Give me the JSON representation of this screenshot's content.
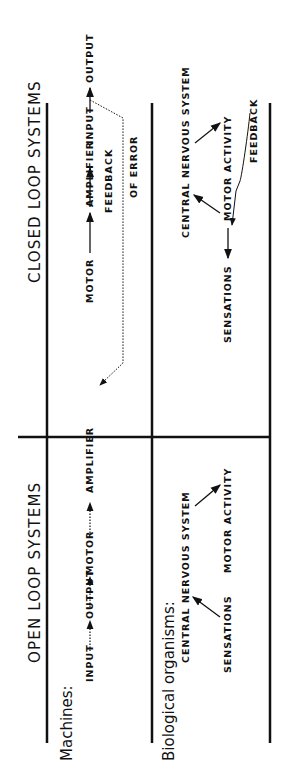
{
  "headers": {
    "open": "OPEN LOOP SYSTEMS",
    "closed": "CLOSED LOOP SYSTEMS"
  },
  "rows": {
    "machines": "Machines:",
    "biological": "Biological organisms:"
  },
  "open_machine": {
    "input": "INPUT",
    "amplifier": "AMPLIFIER",
    "motor": "MOTOR",
    "output": "OUTPUT"
  },
  "closed_machine": {
    "input": "INPUT",
    "amplifier": "AMPLIFIER",
    "motor": "MOTOR",
    "output": "OUTPUT",
    "feedback1": "FEEDBACK",
    "feedback2": "OF ERROR"
  },
  "open_bio": {
    "cns": "CENTRAL NERVOUS SYSTEM",
    "sensations": "SENSATIONS",
    "motor_activity": "MOTOR ACTIVITY"
  },
  "closed_bio": {
    "cns": "CENTRAL NERVOUS SYSTEM",
    "sensations": "SENSATIONS",
    "motor_activity": "MOTOR ACTIVITY",
    "feedback": "FEEDBACK"
  }
}
